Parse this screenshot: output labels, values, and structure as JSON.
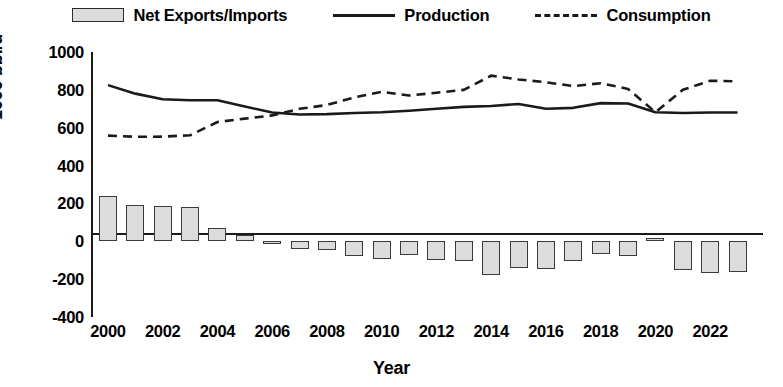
{
  "legend": {
    "items": [
      {
        "label": "Net Exports/Imports",
        "marker": "bar-swatch"
      },
      {
        "label": "Production",
        "marker": "solid-line"
      },
      {
        "label": "Consumption",
        "marker": "dashed-line"
      }
    ]
  },
  "axes": {
    "y_title": "1000 bbl/d",
    "x_title": "Year",
    "y_ticks": [
      "1000",
      "800",
      "600",
      "400",
      "200",
      "0",
      "-200",
      "-400"
    ],
    "x_ticks": [
      "2000",
      "2002",
      "2004",
      "2006",
      "2008",
      "2010",
      "2012",
      "2014",
      "2016",
      "2018",
      "2020",
      "2022"
    ]
  },
  "style": {
    "bar_fill": "#dcdcdc",
    "bar_stroke": "#3a3a3a",
    "line_color": "#1a1a1a",
    "background": "#ffffff"
  },
  "chart_data": {
    "type": "bar",
    "title": "",
    "xlabel": "Year",
    "ylabel": "1000 bbl/d",
    "ylim": [
      -400,
      1000
    ],
    "ytick_step": 200,
    "grid": false,
    "legend_position": "top",
    "categories": [
      2000,
      2001,
      2002,
      2003,
      2004,
      2005,
      2006,
      2007,
      2008,
      2009,
      2010,
      2011,
      2012,
      2013,
      2014,
      2015,
      2016,
      2017,
      2018,
      2019,
      2020,
      2021,
      2022,
      2023
    ],
    "series": [
      {
        "name": "Net Exports/Imports",
        "type": "bar",
        "values": [
          240,
          190,
          185,
          180,
          70,
          35,
          0,
          -40,
          -45,
          -80,
          -95,
          -70,
          -100,
          -105,
          -180,
          -140,
          -145,
          -105,
          -65,
          -80,
          15,
          -150,
          -165,
          -160
        ]
      },
      {
        "name": "Production",
        "type": "line",
        "style": "solid",
        "values": [
          825,
          780,
          750,
          745,
          745,
          712,
          680,
          670,
          672,
          678,
          682,
          690,
          700,
          710,
          715,
          725,
          700,
          705,
          730,
          728,
          682,
          678,
          680,
          680
        ]
      },
      {
        "name": "Consumption",
        "type": "line",
        "style": "dashed",
        "values": [
          558,
          552,
          553,
          560,
          630,
          648,
          665,
          700,
          720,
          760,
          790,
          770,
          785,
          800,
          875,
          855,
          840,
          820,
          835,
          805,
          682,
          800,
          848,
          845
        ]
      }
    ]
  }
}
